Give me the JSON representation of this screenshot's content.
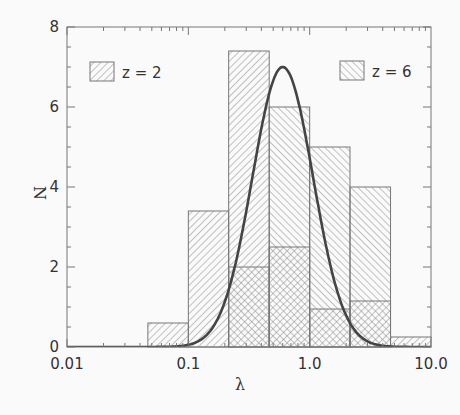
{
  "chart_data": {
    "type": "bar",
    "subtype": "histogram",
    "xscale": "log",
    "xlabel": "λ",
    "ylabel": "N",
    "xlim": [
      0.01,
      10.0
    ],
    "ylim": [
      0,
      8
    ],
    "xticks": [
      "0.01",
      "0.1",
      "1.0",
      "10.0"
    ],
    "yticks": [
      "0",
      "2",
      "4",
      "6",
      "8"
    ],
    "bin_edges": [
      0.0464,
      0.1,
      0.215,
      0.464,
      1.0,
      2.15,
      4.64,
      10.0
    ],
    "series": [
      {
        "name": "z = 2",
        "hatch": "forward",
        "values": [
          0.6,
          3.4,
          7.4,
          2.5,
          0.95,
          1.15,
          0.25
        ]
      },
      {
        "name": "z = 6",
        "hatch": "backward",
        "values": [
          0,
          0,
          2.0,
          6.0,
          5.0,
          4.0,
          0
        ]
      }
    ],
    "curve": {
      "name": "lognormal fit",
      "peak_x": 0.6,
      "peak_y": 7.0,
      "sigma_dex": 0.25
    },
    "legend": [
      {
        "label": "z = 2",
        "position": "top-left"
      },
      {
        "label": "z = 6",
        "position": "top-right"
      }
    ],
    "grid": false
  },
  "colors": {
    "frame": "#777777",
    "hatch": "#888888",
    "curve": "#444444",
    "text": "#333333"
  }
}
